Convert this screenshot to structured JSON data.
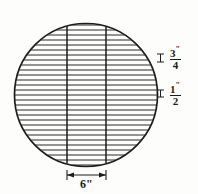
{
  "figure": {
    "background_color": "#fdfdfc",
    "line_color": "#1c1c1c",
    "hatch_color": "#2b2b2b",
    "circle": {
      "center_x": 86,
      "center_y": 95,
      "radius": 72,
      "stroke_width": 1.6
    },
    "hatch": {
      "orientation": "horizontal",
      "spacing_px": 5,
      "count": 28,
      "stroke_width": 1.0
    },
    "vertical_lines": [
      {
        "name": "left-chord-line",
        "x": 67
      },
      {
        "name": "right-chord-line",
        "x": 106
      }
    ],
    "dimensions": {
      "spacing_upper": {
        "name": "hatch-spacing-upper",
        "numerator": "3",
        "denominator": "4",
        "unit": "\"",
        "tick_x": 160,
        "tick_y": 58
      },
      "spacing_lower": {
        "name": "hatch-spacing-lower",
        "numerator": "1",
        "denominator": "2",
        "unit": "\"",
        "tick_x": 160,
        "tick_y": 94
      },
      "width": {
        "name": "chord-width",
        "value": "6\"",
        "from_x": 67,
        "to_x": 106,
        "y": 175
      }
    }
  }
}
